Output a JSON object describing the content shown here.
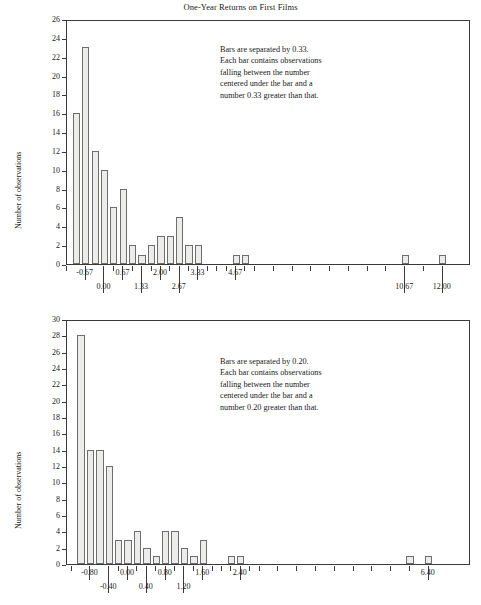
{
  "title": "One-Year Returns on First Films",
  "colors": {
    "bar_fill": "#ececeb",
    "bar_stroke": "#6e6e6e",
    "axis": "#3a3a3a",
    "text": "#1a1a1a"
  },
  "panels": [
    {
      "id": "top",
      "annotation": "Bars are separated by 0.33.\nEach bar contains observations\nfalling between the number\ncentered under the bar and a\nnumber 0.33 greater than that.",
      "ylabel": "Number of observations"
    },
    {
      "id": "bottom",
      "annotation": "Bars are separated by 0.20.\nEach bar contains observations\nfalling between the number\ncentered under the bar and a\nnumber 0.20 greater than that.",
      "ylabel": "Number of observations"
    }
  ],
  "chart_data": [
    {
      "type": "bar",
      "title": "One-Year Returns on First Films",
      "subtitle": "Bars are separated by 0.33.",
      "xlabel": "",
      "ylabel": "Number of observations",
      "ylim": [
        0,
        26
      ],
      "ytick_step": 2,
      "yticks": [
        0,
        2,
        4,
        6,
        8,
        10,
        12,
        14,
        16,
        18,
        20,
        22,
        24,
        26
      ],
      "xlim": [
        -1.33,
        13.0
      ],
      "bin_width": 0.33,
      "grid": false,
      "legend": null,
      "xtick_labeled": [
        {
          "value": -0.67,
          "label": "-0.67",
          "row": 1
        },
        {
          "value": 0.0,
          "label": "0.00",
          "row": 2
        },
        {
          "value": 0.67,
          "label": "0.67",
          "row": 1
        },
        {
          "value": 1.33,
          "label": "1.33",
          "row": 2
        },
        {
          "value": 2.0,
          "label": "2.00",
          "row": 1
        },
        {
          "value": 2.67,
          "label": "2.67",
          "row": 2
        },
        {
          "value": 3.33,
          "label": "3.33",
          "row": 1
        },
        {
          "value": 4.67,
          "label": "4.67",
          "row": 1
        },
        {
          "value": 10.67,
          "label": "10.67",
          "row": 2
        },
        {
          "value": 12.0,
          "label": "12.00",
          "row": 2
        }
      ],
      "xticks_minor": [
        -1.33,
        0.33,
        1.0,
        1.67,
        2.33,
        3.0,
        3.67,
        4.0,
        4.33,
        5.0,
        5.33,
        6.0,
        6.67,
        7.33,
        8.0,
        8.67,
        9.33,
        10.0,
        11.33
      ],
      "x": [
        -1.0,
        -0.67,
        -0.33,
        0.0,
        0.33,
        0.67,
        1.0,
        1.33,
        1.67,
        2.0,
        2.33,
        2.67,
        3.0,
        3.33,
        4.67,
        5.0,
        10.67,
        12.0
      ],
      "values": [
        16,
        23,
        12,
        10,
        6,
        8,
        2,
        1,
        2,
        3,
        3,
        5,
        2,
        2,
        1,
        1,
        1,
        1
      ]
    },
    {
      "type": "bar",
      "title": "",
      "subtitle": "Bars are separated by 0.20.",
      "xlabel": "",
      "ylabel": "Number of observations",
      "ylim": [
        0,
        30
      ],
      "ytick_step": 2,
      "yticks": [
        0,
        2,
        4,
        6,
        8,
        10,
        12,
        14,
        16,
        18,
        20,
        22,
        24,
        26,
        28,
        30
      ],
      "xlim": [
        -1.3,
        7.3
      ],
      "bin_width": 0.2,
      "grid": false,
      "legend": null,
      "xtick_labeled": [
        {
          "value": -0.8,
          "label": "-0.80",
          "row": 1
        },
        {
          "value": -0.4,
          "label": "-0.40",
          "row": 2
        },
        {
          "value": 0.0,
          "label": "0.00",
          "row": 1
        },
        {
          "value": 0.4,
          "label": "0.40",
          "row": 2
        },
        {
          "value": 0.8,
          "label": "0.80",
          "row": 1
        },
        {
          "value": 1.2,
          "label": "1.20",
          "row": 2
        },
        {
          "value": 1.6,
          "label": "1.60",
          "row": 1
        },
        {
          "value": 2.4,
          "label": "2.40",
          "row": 1
        },
        {
          "value": 6.4,
          "label": "6.40",
          "row": 1
        }
      ],
      "xticks_minor": [
        -1.2,
        -0.2,
        0.2,
        0.6,
        1.0,
        1.4,
        1.8,
        2.0,
        2.2,
        2.6,
        2.8,
        3.2,
        3.6,
        4.0,
        4.4,
        4.8,
        5.2,
        5.6,
        6.0
      ],
      "x": [
        -1.0,
        -0.8,
        -0.6,
        -0.4,
        -0.2,
        0.0,
        0.2,
        0.4,
        0.6,
        0.8,
        1.0,
        1.2,
        1.4,
        1.6,
        2.2,
        2.4,
        6.0,
        6.4
      ],
      "values": [
        28,
        14,
        14,
        12,
        3,
        3,
        4,
        2,
        1,
        4,
        4,
        2,
        1,
        3,
        1,
        1,
        1,
        1
      ]
    }
  ]
}
